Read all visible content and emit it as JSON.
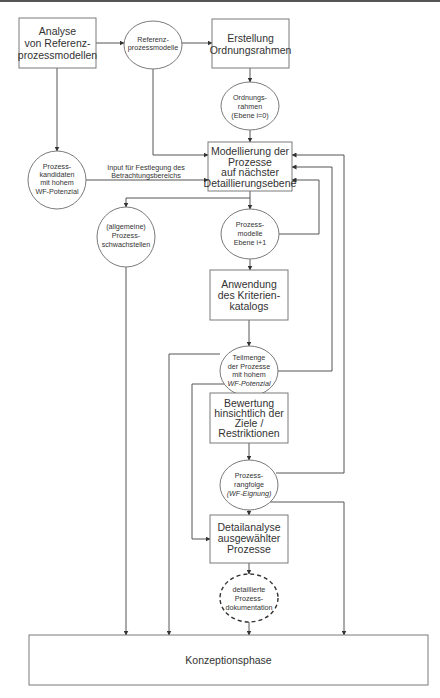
{
  "nodes": {
    "analyse": {
      "shape": "box",
      "lines": [
        "Analyse",
        "von Referenz-",
        "prozessmodellen"
      ]
    },
    "referenz": {
      "shape": "ellipse",
      "lines": [
        "Referenz-",
        "prozessmodelle"
      ]
    },
    "erstellung": {
      "shape": "box",
      "lines": [
        "Erstellung",
        "Ordnungsrahmen"
      ]
    },
    "ordnungsrahmen": {
      "shape": "ellipse",
      "lines": [
        "Ordnungs-",
        "rahmen",
        "(Ebene i=0)"
      ]
    },
    "modellierung": {
      "shape": "box",
      "lines": [
        "Modellierung der",
        "Prozesse",
        "auf nächster",
        "Detaillierungsebene"
      ]
    },
    "kandidaten": {
      "shape": "ellipse",
      "lines": [
        "Prozess-",
        "kandidaten",
        "mit hohem",
        "WF-Potenzial"
      ]
    },
    "schwachstellen": {
      "shape": "ellipse",
      "lines": [
        "(allgemeine)",
        "Prozess-",
        "schwachstellen"
      ]
    },
    "prozessmodelle": {
      "shape": "ellipse",
      "lines": [
        "Prozess-",
        "modelle",
        "Ebene i+1"
      ]
    },
    "anwendung": {
      "shape": "box",
      "lines": [
        "Anwendung",
        "des Kriterien-",
        "katalogs"
      ]
    },
    "teilmenge": {
      "shape": "ellipse",
      "lines": [
        "Teilmenge",
        "der Prozesse",
        "mit hohem"
      ],
      "italic_line": "WF-Potenzial"
    },
    "bewertung": {
      "shape": "box",
      "lines": [
        "Bewertung",
        "hinsichtlich der",
        "Ziele /",
        "Restriktionen"
      ]
    },
    "rangfolge": {
      "shape": "ellipse",
      "lines": [
        "Prozess-",
        "rangfolge"
      ],
      "italic_line": "(WF-Eignung)"
    },
    "detailanalyse": {
      "shape": "box",
      "lines": [
        "Detailanalyse",
        "ausgewählter",
        "Prozesse"
      ]
    },
    "dokumentation": {
      "shape": "dashed-ellipse",
      "lines": [
        "detaillierte",
        "Prozess-",
        "dokumentation"
      ]
    },
    "konzeption": {
      "shape": "box",
      "lines": [
        "Konzeptionsphase"
      ]
    }
  },
  "edge_labels": {
    "input": [
      "Input für Festlegung des",
      "Betrachtungsbereichs"
    ]
  }
}
